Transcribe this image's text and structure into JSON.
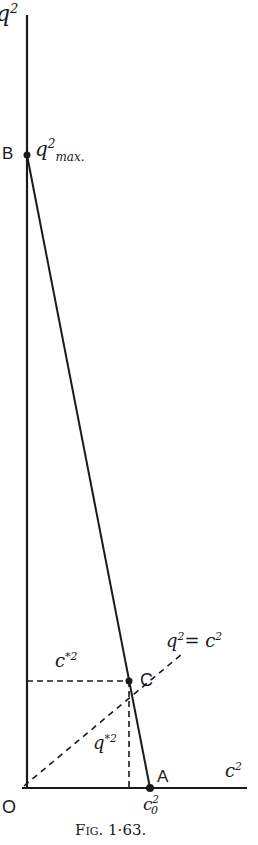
{
  "figure": {
    "caption": "Fig. 1·63.",
    "y_axis_label": "q²",
    "x_axis_label": "c²",
    "origin_label": "O",
    "points": [
      {
        "name": "B",
        "label": "q²max.",
        "x": 0,
        "y_frac": 0.82
      },
      {
        "name": "C",
        "label": "C",
        "x_frac": 0.82,
        "y_frac": 0.14
      },
      {
        "name": "A",
        "label": "A",
        "x_label": "c₀²"
      }
    ],
    "line_label": "q² = c²",
    "dashed_labels": {
      "horizontal": "c*²",
      "vertical": "q*²"
    }
  },
  "labels": {
    "q2": "q",
    "q2_sup": "2",
    "B": "B",
    "qmax": "q",
    "qmax_sup": "2",
    "qmax_sub": "max.",
    "cstar": "c",
    "cstar_sup": "*2",
    "C": "C",
    "qeq": "q",
    "qeq_sup": "2",
    "qeq_rest": "= c",
    "qeq_rest_sup": "2",
    "qstar": "q",
    "qstar_sup": "*2",
    "A": "A",
    "c2": "c",
    "c2_sup": "2",
    "O": "O",
    "c0": "c",
    "c0_sup": "2",
    "c0_sub": "0",
    "caption": "Fig. 1·63."
  }
}
